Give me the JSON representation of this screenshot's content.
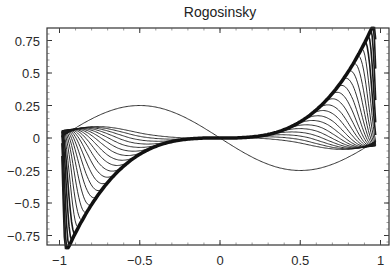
{
  "chart_data": {
    "type": "line",
    "title": "Rogosinsky",
    "xlabel": "",
    "ylabel": "",
    "xlim": [
      -1.06,
      1.05
    ],
    "ylim": [
      -0.85,
      0.85
    ],
    "x_ticks": [
      -1,
      -0.5,
      0,
      0.5,
      1
    ],
    "x_tick_labels": [
      "−1",
      "−0.5",
      "0",
      "0.5",
      "1"
    ],
    "y_ticks": [
      -0.75,
      -0.5,
      -0.25,
      0,
      0.25,
      0.5,
      0.75
    ],
    "y_tick_labels": [
      "−0.75",
      "−0.5",
      "−0.25",
      "0",
      "0.25",
      "0.5",
      "0.75"
    ],
    "grid": false,
    "legend": null,
    "frame": true,
    "line_color": "#1a1a1a",
    "envelope": {
      "name": "y = x^3",
      "x": [
        -1.0,
        -0.9,
        -0.75,
        -0.5,
        -0.25,
        0,
        0.25,
        0.5,
        0.75,
        0.9,
        0.95
      ],
      "y": [
        -1.0,
        -0.73,
        -0.42,
        -0.125,
        -0.016,
        0,
        0.016,
        0.125,
        0.42,
        0.73,
        0.857
      ]
    },
    "series_count": 24,
    "first_curve": {
      "x": [
        -0.9,
        -0.55,
        0,
        0.55,
        0.9
      ],
      "y": [
        0.1,
        0.25,
        0,
        -0.25,
        -0.1
      ]
    },
    "edge_spike_extent": {
      "left_peak": [
        -0.92,
        0.31
      ],
      "right_trough": [
        0.88,
        -0.26
      ]
    }
  }
}
